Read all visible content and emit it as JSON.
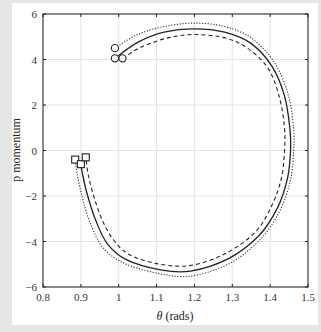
{
  "chart_data": {
    "type": "line",
    "title": "",
    "xlabel": "θ (rads)",
    "xlabel_symbol": "θ",
    "xlabel_unit": "(rads)",
    "ylabel": "p momentum",
    "xlim": [
      0.8,
      1.5
    ],
    "ylim": [
      -6,
      6
    ],
    "xticks": [
      0.8,
      0.9,
      1,
      1.1,
      1.2,
      1.3,
      1.4,
      1.5
    ],
    "xtick_labels": [
      "0.8",
      "0.9",
      "1",
      "1.1",
      "1.2",
      "1.3",
      "1.4",
      "1.5"
    ],
    "yticks": [
      -6,
      -4,
      -2,
      0,
      2,
      4,
      6
    ],
    "ytick_labels": [
      "−6",
      "−4",
      "−2",
      "0",
      "2",
      "4",
      "6"
    ],
    "grid": true,
    "legend": null,
    "start_marker": "circle",
    "end_marker": "square",
    "series": [
      {
        "name": "trajectory-dotted",
        "style": "dotted",
        "color": "#333333",
        "points": [
          [
            0.99,
            4.5
          ],
          [
            1.05,
            5.1
          ],
          [
            1.12,
            5.45
          ],
          [
            1.2,
            5.6
          ],
          [
            1.28,
            5.45
          ],
          [
            1.35,
            4.95
          ],
          [
            1.41,
            3.9
          ],
          [
            1.447,
            2.5
          ],
          [
            1.462,
            1.0
          ],
          [
            1.462,
            0.0
          ],
          [
            1.455,
            -1.2
          ],
          [
            1.43,
            -2.5
          ],
          [
            1.38,
            -3.8
          ],
          [
            1.3,
            -4.9
          ],
          [
            1.2,
            -5.5
          ],
          [
            1.12,
            -5.45
          ],
          [
            1.02,
            -5.0
          ],
          [
            0.96,
            -4.3
          ],
          [
            0.925,
            -3.2
          ],
          [
            0.903,
            -2.0
          ],
          [
            0.89,
            -1.0
          ],
          [
            0.885,
            -0.4
          ]
        ]
      },
      {
        "name": "trajectory-solid",
        "style": "solid",
        "color": "#222222",
        "points": [
          [
            0.99,
            4.05
          ],
          [
            1.05,
            4.75
          ],
          [
            1.12,
            5.2
          ],
          [
            1.2,
            5.35
          ],
          [
            1.28,
            5.2
          ],
          [
            1.35,
            4.7
          ],
          [
            1.405,
            3.7
          ],
          [
            1.438,
            2.4
          ],
          [
            1.452,
            1.0
          ],
          [
            1.454,
            0.0
          ],
          [
            1.446,
            -1.2
          ],
          [
            1.42,
            -2.5
          ],
          [
            1.37,
            -3.75
          ],
          [
            1.29,
            -4.75
          ],
          [
            1.19,
            -5.3
          ],
          [
            1.11,
            -5.25
          ],
          [
            1.02,
            -4.8
          ],
          [
            0.97,
            -4.1
          ],
          [
            0.94,
            -3.1
          ],
          [
            0.918,
            -2.0
          ],
          [
            0.905,
            -1.1
          ],
          [
            0.9,
            -0.6
          ]
        ]
      },
      {
        "name": "trajectory-dashed",
        "style": "dashed",
        "color": "#222222",
        "points": [
          [
            1.01,
            4.05
          ],
          [
            1.06,
            4.55
          ],
          [
            1.13,
            4.95
          ],
          [
            1.2,
            5.1
          ],
          [
            1.28,
            4.95
          ],
          [
            1.34,
            4.5
          ],
          [
            1.395,
            3.6
          ],
          [
            1.425,
            2.3
          ],
          [
            1.438,
            1.0
          ],
          [
            1.438,
            0.0
          ],
          [
            1.43,
            -1.2
          ],
          [
            1.405,
            -2.4
          ],
          [
            1.36,
            -3.6
          ],
          [
            1.28,
            -4.55
          ],
          [
            1.19,
            -5.05
          ],
          [
            1.11,
            -5.0
          ],
          [
            1.03,
            -4.6
          ],
          [
            0.985,
            -3.9
          ],
          [
            0.955,
            -3.0
          ],
          [
            0.934,
            -2.0
          ],
          [
            0.92,
            -1.1
          ],
          [
            0.913,
            -0.3
          ]
        ]
      }
    ]
  }
}
